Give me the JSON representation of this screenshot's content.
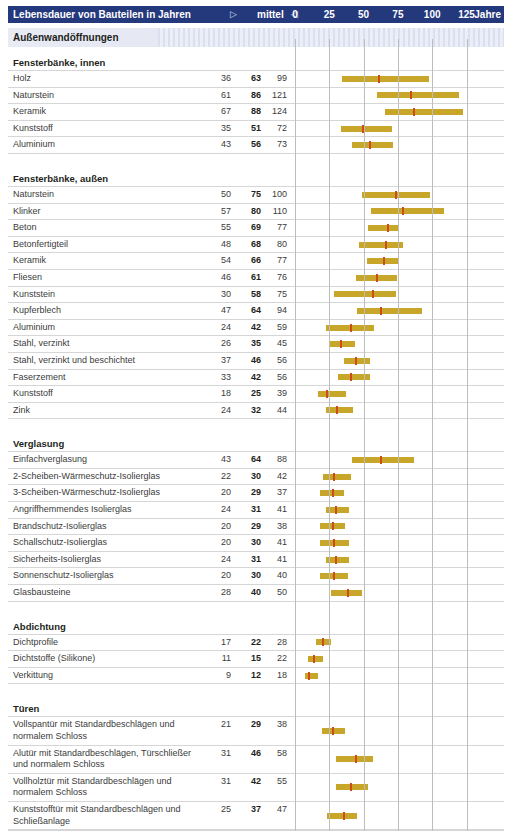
{
  "header": {
    "title": "Lebensdauer von Bauteilen in Jahren",
    "tri_right": "▷",
    "mid_label": "mittel",
    "tri_left": "◁",
    "ticks": [
      "0",
      "25",
      "50",
      "75",
      "100",
      "125"
    ],
    "unit": "Jahre",
    "bg_color": "#24387c",
    "text_color": "#ffffff"
  },
  "band": {
    "label": "Außenwandöffnungen"
  },
  "colors": {
    "bar": "#c8a62a",
    "median": "#cf4c18",
    "grid": "#bdbdbd",
    "rule": "#d6d6d6"
  },
  "axis": {
    "min": 0,
    "max": 135,
    "ticks": [
      0,
      25,
      50,
      75,
      100,
      125
    ]
  },
  "columns": {
    "label": "",
    "min": "",
    "mid": "",
    "max": ""
  },
  "chart_data": {
    "type": "bar",
    "title": "Lebensdauer von Bauteilen in Jahren",
    "xlabel": "Jahre",
    "ylabel": "",
    "xlim": [
      0,
      135
    ],
    "grid": true,
    "legend": "min / mittel / max",
    "groups": [
      {
        "name": "Fensterbänke, innen",
        "rows": [
          {
            "label": "Holz",
            "min": 36,
            "mid": 63,
            "max": 99
          },
          {
            "label": "Naturstein",
            "min": 61,
            "mid": 86,
            "max": 121
          },
          {
            "label": "Keramik",
            "min": 67,
            "mid": 88,
            "max": 124
          },
          {
            "label": "Kunststoff",
            "min": 35,
            "mid": 51,
            "max": 72
          },
          {
            "label": "Aluminium",
            "min": 43,
            "mid": 56,
            "max": 73
          }
        ]
      },
      {
        "name": "Fensterbänke, außen",
        "rows": [
          {
            "label": "Naturstein",
            "min": 50,
            "mid": 75,
            "max": 100
          },
          {
            "label": "Klinker",
            "min": 57,
            "mid": 80,
            "max": 110
          },
          {
            "label": "Beton",
            "min": 55,
            "mid": 69,
            "max": 77
          },
          {
            "label": "Betonfertigteil",
            "min": 48,
            "mid": 68,
            "max": 80
          },
          {
            "label": "Keramik",
            "min": 54,
            "mid": 66,
            "max": 77
          },
          {
            "label": "Fliesen",
            "min": 46,
            "mid": 61,
            "max": 76
          },
          {
            "label": "Kunststein",
            "min": 30,
            "mid": 58,
            "max": 75
          },
          {
            "label": "Kupferblech",
            "min": 47,
            "mid": 64,
            "max": 94
          },
          {
            "label": "Aluminium",
            "min": 24,
            "mid": 42,
            "max": 59
          },
          {
            "label": "Stahl, verzinkt",
            "min": 26,
            "mid": 35,
            "max": 45
          },
          {
            "label": "Stahl, verzinkt und beschichtet",
            "min": 37,
            "mid": 46,
            "max": 56
          },
          {
            "label": "Faserzement",
            "min": 33,
            "mid": 42,
            "max": 56
          },
          {
            "label": "Kunststoff",
            "min": 18,
            "mid": 25,
            "max": 39
          },
          {
            "label": "Zink",
            "min": 24,
            "mid": 32,
            "max": 44
          }
        ]
      },
      {
        "name": "Verglasung",
        "rows": [
          {
            "label": "Einfachverglasung",
            "min": 43,
            "mid": 64,
            "max": 88
          },
          {
            "label": "2-Scheiben-Wärmeschutz-Isolierglas",
            "min": 22,
            "mid": 30,
            "max": 42
          },
          {
            "label": "3-Scheiben-Wärmeschutz-Isolierglas",
            "min": 20,
            "mid": 29,
            "max": 37
          },
          {
            "label": "Angriffhemmendes Isolierglas",
            "min": 24,
            "mid": 31,
            "max": 41
          },
          {
            "label": "Brandschutz-Isolierglas",
            "min": 20,
            "mid": 29,
            "max": 38
          },
          {
            "label": "Schallschutz-Isolierglas",
            "min": 20,
            "mid": 30,
            "max": 41
          },
          {
            "label": "Sicherheits-Isolierglas",
            "min": 24,
            "mid": 31,
            "max": 41
          },
          {
            "label": "Sonnenschutz-Isolierglas",
            "min": 20,
            "mid": 30,
            "max": 40
          },
          {
            "label": "Glasbausteine",
            "min": 28,
            "mid": 40,
            "max": 50
          }
        ]
      },
      {
        "name": "Abdichtung",
        "rows": [
          {
            "label": "Dichtprofile",
            "min": 17,
            "mid": 22,
            "max": 28
          },
          {
            "label": "Dichtstoffe (Silikone)",
            "min": 11,
            "mid": 15,
            "max": 22
          },
          {
            "label": "Verkittung",
            "min": 9,
            "mid": 12,
            "max": 18
          }
        ]
      },
      {
        "name": "Türen",
        "rows": [
          {
            "label": "Vollspantür mit Standardbeschlägen und normalem Schloss",
            "min": 21,
            "mid": 29,
            "max": 38
          },
          {
            "label": "Alutür mit Standardbeschlägen, Türschließer und normalem Schloss",
            "min": 31,
            "mid": 46,
            "max": 58
          },
          {
            "label": "Vollholztür mit Standardbeschlägen und normalem Schloss",
            "min": 31,
            "mid": 42,
            "max": 55
          },
          {
            "label": "Kunststofftür mit Standardbeschlägen und Schließanlage",
            "min": 25,
            "mid": 37,
            "max": 47
          }
        ]
      }
    ]
  }
}
